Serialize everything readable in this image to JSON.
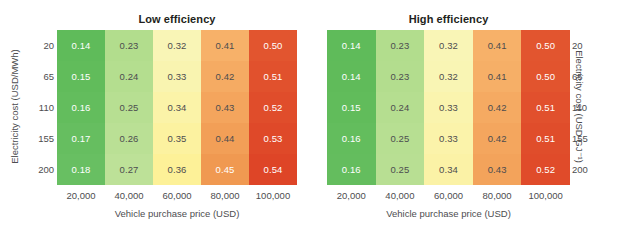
{
  "figure": {
    "background": "#ffffff",
    "text_color": "#4d4d4f",
    "title_color": "#231f20"
  },
  "panels": [
    {
      "key": "low_efficiency",
      "title": "Low efficiency",
      "x_axis_title": "Vehicle purchase price (USD)",
      "y_axis_title": "Electricity cost (USD/MWh)",
      "y_axis_side": "left"
    },
    {
      "key": "high_efficiency",
      "title": "High efficiency",
      "x_axis_title": "Vehicle purchase price (USD)",
      "y_axis_title": "Electricity cost (USD GJ⁻¹)",
      "y_axis_side": "right"
    }
  ],
  "chart_data": [
    {
      "type": "heatmap",
      "title": "Low efficiency",
      "xlabel": "Vehicle purchase price (USD)",
      "ylabel": "Electricity cost (USD/MWh)",
      "x_categories": [
        "20,000",
        "40,000",
        "60,000",
        "80,000",
        "100,000"
      ],
      "y_categories": [
        "20",
        "65",
        "110",
        "155",
        "200"
      ],
      "values": [
        [
          0.14,
          0.23,
          0.32,
          0.41,
          0.5
        ],
        [
          0.15,
          0.24,
          0.33,
          0.42,
          0.51
        ],
        [
          0.16,
          0.25,
          0.34,
          0.43,
          0.52
        ],
        [
          0.17,
          0.26,
          0.35,
          0.44,
          0.53
        ],
        [
          0.18,
          0.27,
          0.36,
          0.45,
          0.54
        ]
      ],
      "cell_colors": [
        [
          "#5fbb5a",
          "#b2dd8d",
          "#f9f5b6",
          "#f7b169",
          "#e2552f"
        ],
        [
          "#61bc5b",
          "#b4de8f",
          "#f9f4b0",
          "#f5ab63",
          "#e1512d"
        ],
        [
          "#63bd5d",
          "#b7df92",
          "#fbf3a8",
          "#f4a55d",
          "#e04d2b"
        ],
        [
          "#66be60",
          "#bae095",
          "#fcf2a0",
          "#f29f57",
          "#df4929"
        ],
        [
          "#68bf62",
          "#bde198",
          "#fdf198",
          "#f09951",
          "#de4527"
        ]
      ],
      "label_colors": [
        [
          "#ffffff",
          "#4d4d4f",
          "#4d4d4f",
          "#4d4d4f",
          "#ffffff"
        ],
        [
          "#ffffff",
          "#4d4d4f",
          "#4d4d4f",
          "#4d4d4f",
          "#ffffff"
        ],
        [
          "#ffffff",
          "#4d4d4f",
          "#4d4d4f",
          "#4d4d4f",
          "#ffffff"
        ],
        [
          "#ffffff",
          "#4d4d4f",
          "#4d4d4f",
          "#4d4d4f",
          "#ffffff"
        ],
        [
          "#ffffff",
          "#4d4d4f",
          "#4d4d4f",
          "#ffffff",
          "#ffffff"
        ]
      ],
      "colormap": "RdYlGn reversed",
      "grid": false,
      "legend": "none"
    },
    {
      "type": "heatmap",
      "title": "High efficiency",
      "xlabel": "Vehicle purchase price (USD)",
      "ylabel": "Electricity cost (USD GJ⁻¹)",
      "x_categories": [
        "20,000",
        "40,000",
        "60,000",
        "80,000",
        "100,000"
      ],
      "y_categories": [
        "20",
        "65",
        "110",
        "155",
        "200"
      ],
      "values": [
        [
          0.14,
          0.23,
          0.32,
          0.41,
          0.5
        ],
        [
          0.14,
          0.23,
          0.32,
          0.41,
          0.5
        ],
        [
          0.15,
          0.24,
          0.33,
          0.42,
          0.51
        ],
        [
          0.16,
          0.25,
          0.33,
          0.42,
          0.51
        ],
        [
          0.16,
          0.25,
          0.34,
          0.43,
          0.52
        ]
      ],
      "cell_colors": [
        [
          "#5fbb5a",
          "#b2dd8d",
          "#f9f5b6",
          "#f7b169",
          "#e2552f"
        ],
        [
          "#60bb5a",
          "#b3dd8e",
          "#f9f5b4",
          "#f6af67",
          "#e2542e"
        ],
        [
          "#61bc5b",
          "#b5de90",
          "#faf4ae",
          "#f5aa62",
          "#e1502d"
        ],
        [
          "#63bd5d",
          "#b7df92",
          "#fbf3aa",
          "#f4a65e",
          "#e04d2b"
        ],
        [
          "#64bd5e",
          "#b8df93",
          "#fbf2a6",
          "#f3a35b",
          "#e04b2a"
        ]
      ],
      "label_colors": [
        [
          "#ffffff",
          "#4d4d4f",
          "#4d4d4f",
          "#4d4d4f",
          "#ffffff"
        ],
        [
          "#ffffff",
          "#4d4d4f",
          "#4d4d4f",
          "#4d4d4f",
          "#ffffff"
        ],
        [
          "#ffffff",
          "#4d4d4f",
          "#4d4d4f",
          "#4d4d4f",
          "#ffffff"
        ],
        [
          "#ffffff",
          "#4d4d4f",
          "#4d4d4f",
          "#4d4d4f",
          "#ffffff"
        ],
        [
          "#ffffff",
          "#4d4d4f",
          "#4d4d4f",
          "#4d4d4f",
          "#ffffff"
        ]
      ],
      "colormap": "RdYlGn reversed",
      "grid": false,
      "legend": "none"
    }
  ]
}
